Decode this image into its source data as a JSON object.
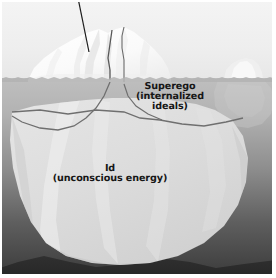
{
  "diagram": {
    "labels": {
      "superego": {
        "line1": "Superego",
        "line2": "(internalized",
        "line3": "ideals)"
      },
      "id": {
        "line1": "Id",
        "line2": "(unconscious energy)"
      }
    },
    "annotations": {
      "leader_line": "pointer-line-to-iceberg-tip"
    },
    "elements": {
      "sky": "sky-background",
      "water": "ocean-water",
      "waterline": "water-surface-line",
      "iceberg_above": "iceberg-above-water",
      "iceberg_below": "iceberg-below-water",
      "background_iceberg": "small-background-iceberg",
      "seabed": "dark-seabed-band",
      "frame": "white-border-frame"
    },
    "colors": {
      "sky_top": "#f2f2f2",
      "sky_bottom": "#e9e9e9",
      "water_top": "#bcbcbc",
      "water_bottom": "#2f2f2f",
      "iceberg_above": "#fbfbfb",
      "iceberg_below": "#dcdcdc",
      "division_line": "#6f6f6f",
      "leader_line": "#1c1c1c",
      "seabed": "#2b2b2b",
      "text": "#161616",
      "frame": "#ffffff"
    }
  }
}
